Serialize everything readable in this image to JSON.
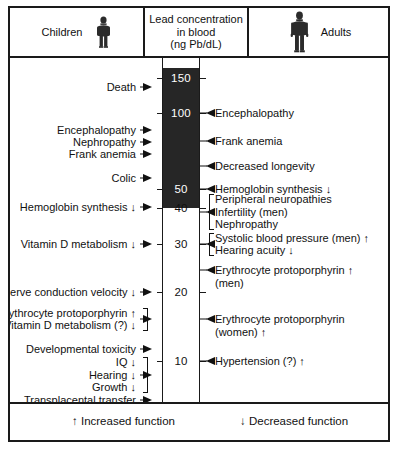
{
  "header": {
    "children_label": "Children",
    "scale_title_line1": "Lead concentration",
    "scale_title_line2": "in blood",
    "scale_title_line3": "(ng Pb/dL)",
    "adults_label": "Adults",
    "child_icon": "child-figure-icon",
    "adult_icon": "adult-figure-icon"
  },
  "scale": {
    "unit": "ng Pb/dL",
    "ticks": [
      150,
      100,
      50,
      40,
      30,
      20,
      10
    ],
    "tick_labels": [
      "150",
      "100",
      "50",
      "40",
      "30",
      "20",
      "10"
    ],
    "dark_region_above": 40,
    "axis_top_value": 160,
    "axis_bottom_value": 3,
    "dark_color": "#262626",
    "line_color": "#1a1a1a"
  },
  "chart_data": {
    "type": "table",
    "title": "Lead concentration in blood (ng Pb/dL)",
    "ylabel": "Lead concentration in blood (ng Pb/dL)",
    "ylim": [
      3,
      160
    ],
    "tick_values": [
      150,
      100,
      50,
      40,
      30,
      20,
      10
    ],
    "children": [
      {
        "label": "Death",
        "value": 150,
        "arrow": ""
      },
      {
        "label": "Encephalopathy",
        "value": 100,
        "arrow": ""
      },
      {
        "label": "Nephropathy",
        "value": 92,
        "arrow": ""
      },
      {
        "label": "Frank anemia",
        "value": 84,
        "arrow": ""
      },
      {
        "label": "Colic",
        "value": 66,
        "arrow": ""
      },
      {
        "label": "Hemoglobin synthesis",
        "value": 50,
        "arrow": "↓"
      },
      {
        "label": "Vitamin D metabolism",
        "value": 40,
        "arrow": "↓"
      },
      {
        "label": "Nerve conduction velocity",
        "value": 30,
        "arrow": "↓"
      },
      {
        "label": "Erythrocyte protoporphyrin",
        "value": 20,
        "arrow": "↑",
        "group": "g1"
      },
      {
        "label": "Vitamin D metabolism (?)",
        "value": 20,
        "arrow": "↓",
        "group": "g1"
      },
      {
        "label": "Developmental toxicity",
        "value": 15,
        "arrow": ""
      },
      {
        "label": "IQ",
        "value": 12,
        "arrow": "↓",
        "group": "g2"
      },
      {
        "label": "Hearing",
        "value": 11,
        "arrow": "↓",
        "group": "g2"
      },
      {
        "label": "Growth",
        "value": 10,
        "arrow": "↓",
        "group": "g2"
      },
      {
        "label": "Transplacental transfer",
        "value": 8,
        "arrow": ""
      }
    ],
    "adults": [
      {
        "label": "Encephalopathy",
        "value": 100,
        "arrow": ""
      },
      {
        "label": "Frank anemia",
        "value": 85,
        "arrow": ""
      },
      {
        "label": "Decreased longevity",
        "value": 70,
        "arrow": ""
      },
      {
        "label": "Hemoglobin synthesis",
        "value": 50,
        "arrow": "↓"
      },
      {
        "label": "Peripheral neuropathies",
        "value": 42,
        "arrow": "",
        "group": "a1"
      },
      {
        "label": "Infertility (men)",
        "value": 40,
        "arrow": "",
        "group": "a1"
      },
      {
        "label": "Nephropathy",
        "value": 38,
        "arrow": "",
        "group": "a1"
      },
      {
        "label": "Systolic blood pressure (men)",
        "value": 31,
        "arrow": "↑",
        "group": "a2"
      },
      {
        "label": "Hearing acuity",
        "value": 29,
        "arrow": "↓",
        "group": "a2"
      },
      {
        "label": "Erythrocyte protoporphyrin (men)",
        "value": 25,
        "arrow": "↑"
      },
      {
        "label": "Erythrocyte protoporphyrin (women)",
        "value": 17,
        "arrow": "↑"
      },
      {
        "label": "Hypertension (?)",
        "value": 10,
        "arrow": "↑"
      }
    ]
  },
  "children_entries": [
    {
      "line1": "Death",
      "y": 79
    },
    {
      "line1": "Encephalopathy",
      "y": 122
    },
    {
      "line1": "Nephropathy",
      "y": 134
    },
    {
      "line1": "Frank anemia",
      "y": 146
    },
    {
      "line1": "Colic",
      "y": 170
    },
    {
      "line1": "Hemoglobin synthesis ↓",
      "y": 199
    },
    {
      "line1": "Vitamin D metabolism ↓",
      "y": 236
    },
    {
      "line1": "Nerve conduction velocity ↓",
      "y": 284
    },
    {
      "line1": "Developmental toxicity",
      "y": 341
    },
    {
      "line1": "Transplacental transfer",
      "y": 392
    }
  ],
  "children_groups": [
    {
      "rows": [
        "Erythrocyte protoporphyrin ↑",
        "Vitamin D metabolism (?) ↓"
      ],
      "y": 311
    },
    {
      "rows": [
        "IQ ↓",
        "Hearing ↓",
        "Growth ↓"
      ],
      "y": 367
    }
  ],
  "adult_entries": [
    {
      "line1": "Encephalopathy",
      "y": 105
    },
    {
      "line1": "Frank anemia",
      "y": 133
    },
    {
      "line1": "Decreased longevity",
      "y": 158
    },
    {
      "line1": "Hemoglobin synthesis ↓",
      "y": 181
    },
    {
      "line1": "Erythrocyte protoporphyrin ↑",
      "line2": "(men)",
      "y": 262
    },
    {
      "line1": "Erythrocyte protoporphyrin",
      "line2": "(women) ↑",
      "y": 311
    },
    {
      "line1": "Hypertension (?) ↑",
      "y": 353
    }
  ],
  "adult_groups": [
    {
      "rows": [
        "Peripheral neuropathies",
        "Infertility (men)",
        "Nephropathy"
      ],
      "y": 204
    },
    {
      "rows": [
        "Systolic blood pressure (men) ↑",
        "Hearing acuity ↓"
      ],
      "y": 236
    }
  ],
  "legend": {
    "increased": "↑ Increased function",
    "decreased": "↓ Decreased function"
  }
}
